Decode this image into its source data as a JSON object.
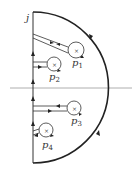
{
  "diagram": {
    "type": "contour-plot",
    "axis_label": "j",
    "poles": [
      {
        "label": "p",
        "sub": "1",
        "cx": 76,
        "cy": 50,
        "r": 8,
        "lx": 72,
        "ly": 66
      },
      {
        "label": "p",
        "sub": "2",
        "cx": 54,
        "cy": 64,
        "r": 7,
        "lx": 49,
        "ly": 80
      },
      {
        "label": "p",
        "sub": "3",
        "cx": 74,
        "cy": 108,
        "r": 7,
        "lx": 71,
        "ly": 124
      },
      {
        "label": "p",
        "sub": "4",
        "cx": 46,
        "cy": 130,
        "r": 7,
        "lx": 42,
        "ly": 148
      }
    ],
    "colors": {
      "line": "#222222",
      "axis": "#888888"
    }
  }
}
